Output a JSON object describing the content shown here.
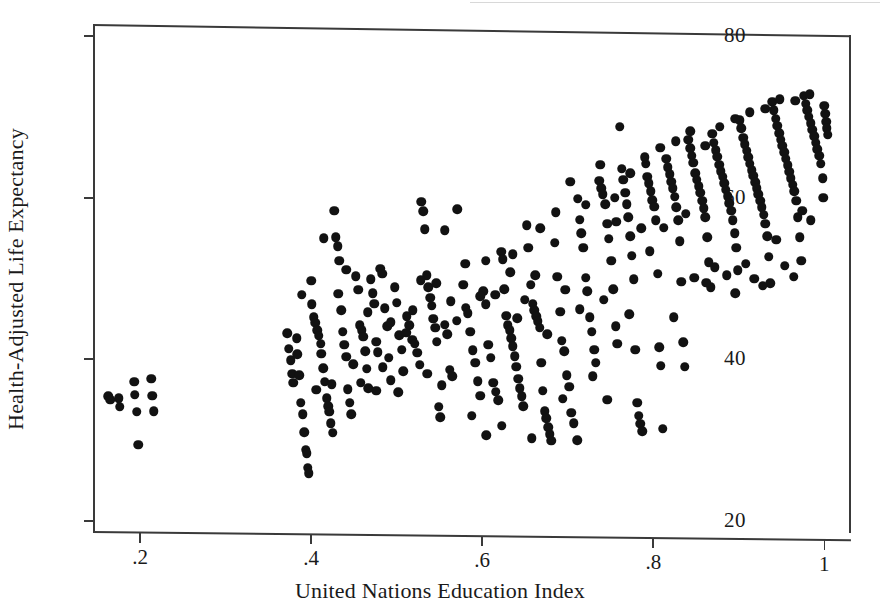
{
  "figure": {
    "kind": "scatterplot",
    "background_color": "#ffffff",
    "ink_color": "#121212",
    "axis_color": "#3a3a3a"
  },
  "chart_data": {
    "type": "scatter",
    "title": "",
    "xlabel": "United Nations Education Index",
    "ylabel": "Health-Adjusted Life Expectancy",
    "xlim": [
      0.145,
      1.03
    ],
    "ylim": [
      18.5,
      81.5
    ],
    "xticks": [
      0.2,
      0.4,
      0.6,
      0.8,
      1
    ],
    "xtick_labels": [
      ".2",
      ".4",
      ".6",
      ".8",
      "1"
    ],
    "yticks": [
      20,
      40,
      60,
      80
    ],
    "ytick_labels": [
      "20",
      "40",
      "60",
      "80"
    ],
    "grid": false,
    "legend": null,
    "marker": "filled-circle",
    "marker_color": "#121212",
    "marker_size_px": 9.5,
    "n_points": 430,
    "points": [
      [
        0.163,
        35.4
      ],
      [
        0.165,
        35.0
      ],
      [
        0.175,
        35.2
      ],
      [
        0.176,
        34.1
      ],
      [
        0.193,
        37.2
      ],
      [
        0.194,
        35.6
      ],
      [
        0.196,
        33.5
      ],
      [
        0.198,
        29.4
      ],
      [
        0.213,
        37.6
      ],
      [
        0.214,
        35.5
      ],
      [
        0.216,
        33.6
      ],
      [
        0.372,
        43.2
      ],
      [
        0.374,
        41.3
      ],
      [
        0.376,
        39.9
      ],
      [
        0.378,
        38.2
      ],
      [
        0.379,
        37.1
      ],
      [
        0.383,
        42.6
      ],
      [
        0.384,
        40.6
      ],
      [
        0.386,
        38.0
      ],
      [
        0.388,
        34.6
      ],
      [
        0.39,
        33.2
      ],
      [
        0.392,
        31.0
      ],
      [
        0.394,
        28.8
      ],
      [
        0.395,
        28.4
      ],
      [
        0.396,
        26.6
      ],
      [
        0.397,
        25.9
      ],
      [
        0.4,
        49.7
      ],
      [
        0.401,
        46.8
      ],
      [
        0.403,
        45.2
      ],
      [
        0.405,
        44.5
      ],
      [
        0.407,
        43.6
      ],
      [
        0.409,
        42.9
      ],
      [
        0.411,
        41.9
      ],
      [
        0.412,
        40.7
      ],
      [
        0.414,
        38.9
      ],
      [
        0.416,
        37.2
      ],
      [
        0.418,
        35.2
      ],
      [
        0.42,
        34.2
      ],
      [
        0.421,
        33.5
      ],
      [
        0.423,
        32.1
      ],
      [
        0.425,
        30.9
      ],
      [
        0.427,
        58.4
      ],
      [
        0.429,
        55.1
      ],
      [
        0.431,
        54.0
      ],
      [
        0.433,
        52.2
      ],
      [
        0.435,
        46.1
      ],
      [
        0.437,
        43.4
      ],
      [
        0.439,
        41.8
      ],
      [
        0.441,
        40.3
      ],
      [
        0.443,
        36.3
      ],
      [
        0.445,
        34.6
      ],
      [
        0.447,
        33.2
      ],
      [
        0.452,
        50.3
      ],
      [
        0.455,
        48.6
      ],
      [
        0.457,
        44.2
      ],
      [
        0.459,
        43.6
      ],
      [
        0.461,
        42.8
      ],
      [
        0.463,
        41.0
      ],
      [
        0.465,
        38.8
      ],
      [
        0.467,
        36.4
      ],
      [
        0.47,
        49.9
      ],
      [
        0.472,
        48.2
      ],
      [
        0.474,
        46.9
      ],
      [
        0.476,
        42.2
      ],
      [
        0.478,
        40.9
      ],
      [
        0.481,
        51.2
      ],
      [
        0.483,
        50.6
      ],
      [
        0.486,
        46.3
      ],
      [
        0.489,
        44.1
      ],
      [
        0.491,
        40.2
      ],
      [
        0.493,
        37.4
      ],
      [
        0.498,
        48.9
      ],
      [
        0.5,
        47.0
      ],
      [
        0.503,
        43.0
      ],
      [
        0.506,
        41.2
      ],
      [
        0.508,
        38.5
      ],
      [
        0.512,
        45.3
      ],
      [
        0.515,
        44.2
      ],
      [
        0.518,
        42.4
      ],
      [
        0.521,
        41.9
      ],
      [
        0.524,
        40.8
      ],
      [
        0.527,
        39.3
      ],
      [
        0.529,
        59.5
      ],
      [
        0.531,
        58.3
      ],
      [
        0.533,
        56.1
      ],
      [
        0.535,
        50.4
      ],
      [
        0.537,
        48.9
      ],
      [
        0.539,
        47.6
      ],
      [
        0.541,
        46.6
      ],
      [
        0.543,
        45.0
      ],
      [
        0.545,
        43.9
      ],
      [
        0.547,
        42.2
      ],
      [
        0.549,
        34.1
      ],
      [
        0.551,
        32.8
      ],
      [
        0.556,
        44.3
      ],
      [
        0.559,
        43.1
      ],
      [
        0.562,
        38.7
      ],
      [
        0.565,
        37.9
      ],
      [
        0.578,
        49.2
      ],
      [
        0.581,
        46.4
      ],
      [
        0.583,
        45.7
      ],
      [
        0.586,
        43.4
      ],
      [
        0.589,
        41.1
      ],
      [
        0.592,
        39.6
      ],
      [
        0.595,
        37.3
      ],
      [
        0.598,
        35.5
      ],
      [
        0.601,
        48.4
      ],
      [
        0.604,
        46.8
      ],
      [
        0.607,
        41.8
      ],
      [
        0.61,
        40.2
      ],
      [
        0.613,
        37.1
      ],
      [
        0.616,
        36.0
      ],
      [
        0.619,
        34.9
      ],
      [
        0.622,
        53.3
      ],
      [
        0.624,
        52.4
      ],
      [
        0.626,
        48.7
      ],
      [
        0.628,
        45.4
      ],
      [
        0.63,
        44.2
      ],
      [
        0.632,
        43.6
      ],
      [
        0.634,
        42.6
      ],
      [
        0.636,
        41.6
      ],
      [
        0.638,
        40.4
      ],
      [
        0.64,
        39.1
      ],
      [
        0.642,
        37.6
      ],
      [
        0.644,
        36.4
      ],
      [
        0.646,
        35.4
      ],
      [
        0.648,
        34.2
      ],
      [
        0.652,
        56.6
      ],
      [
        0.654,
        53.8
      ],
      [
        0.657,
        49.2
      ],
      [
        0.659,
        46.9
      ],
      [
        0.661,
        46.1
      ],
      [
        0.663,
        45.3
      ],
      [
        0.665,
        44.7
      ],
      [
        0.667,
        43.9
      ],
      [
        0.669,
        39.6
      ],
      [
        0.671,
        36.1
      ],
      [
        0.673,
        33.6
      ],
      [
        0.675,
        32.7
      ],
      [
        0.677,
        31.6
      ],
      [
        0.679,
        30.7
      ],
      [
        0.681,
        29.9
      ],
      [
        0.685,
        54.4
      ],
      [
        0.688,
        50.2
      ],
      [
        0.691,
        45.9
      ],
      [
        0.693,
        42.3
      ],
      [
        0.696,
        41.0
      ],
      [
        0.699,
        38.0
      ],
      [
        0.702,
        36.6
      ],
      [
        0.704,
        33.4
      ],
      [
        0.707,
        32.1
      ],
      [
        0.712,
        59.9
      ],
      [
        0.714,
        57.3
      ],
      [
        0.716,
        55.6
      ],
      [
        0.718,
        53.8
      ],
      [
        0.721,
        50.1
      ],
      [
        0.723,
        48.4
      ],
      [
        0.726,
        45.2
      ],
      [
        0.728,
        43.4
      ],
      [
        0.731,
        41.2
      ],
      [
        0.733,
        39.6
      ],
      [
        0.737,
        62.1
      ],
      [
        0.739,
        61.2
      ],
      [
        0.741,
        60.4
      ],
      [
        0.744,
        59.2
      ],
      [
        0.746,
        56.8
      ],
      [
        0.748,
        54.9
      ],
      [
        0.751,
        52.2
      ],
      [
        0.753,
        48.7
      ],
      [
        0.756,
        44.1
      ],
      [
        0.758,
        41.9
      ],
      [
        0.761,
        68.8
      ],
      [
        0.763,
        63.6
      ],
      [
        0.765,
        62.2
      ],
      [
        0.767,
        60.6
      ],
      [
        0.769,
        59.2
      ],
      [
        0.771,
        57.6
      ],
      [
        0.773,
        55.2
      ],
      [
        0.775,
        52.8
      ],
      [
        0.777,
        49.9
      ],
      [
        0.779,
        41.2
      ],
      [
        0.781,
        34.6
      ],
      [
        0.783,
        33.0
      ],
      [
        0.785,
        32.0
      ],
      [
        0.787,
        31.1
      ],
      [
        0.791,
        64.2
      ],
      [
        0.793,
        62.6
      ],
      [
        0.795,
        61.8
      ],
      [
        0.797,
        60.8
      ],
      [
        0.799,
        59.7
      ],
      [
        0.801,
        58.9
      ],
      [
        0.803,
        57.2
      ],
      [
        0.805,
        50.6
      ],
      [
        0.807,
        41.5
      ],
      [
        0.809,
        39.2
      ],
      [
        0.811,
        31.4
      ],
      [
        0.815,
        64.8
      ],
      [
        0.817,
        63.8
      ],
      [
        0.819,
        62.9
      ],
      [
        0.821,
        62.0
      ],
      [
        0.823,
        61.2
      ],
      [
        0.825,
        60.1
      ],
      [
        0.827,
        58.8
      ],
      [
        0.829,
        57.2
      ],
      [
        0.831,
        54.6
      ],
      [
        0.833,
        49.6
      ],
      [
        0.835,
        42.1
      ],
      [
        0.837,
        39.1
      ],
      [
        0.841,
        67.2
      ],
      [
        0.843,
        66.1
      ],
      [
        0.845,
        65.2
      ],
      [
        0.847,
        64.3
      ],
      [
        0.849,
        63.0
      ],
      [
        0.851,
        62.2
      ],
      [
        0.853,
        61.4
      ],
      [
        0.855,
        60.6
      ],
      [
        0.857,
        59.6
      ],
      [
        0.859,
        58.7
      ],
      [
        0.861,
        57.6
      ],
      [
        0.863,
        55.1
      ],
      [
        0.865,
        52.0
      ],
      [
        0.867,
        48.9
      ],
      [
        0.869,
        67.9
      ],
      [
        0.871,
        66.8
      ],
      [
        0.873,
        65.9
      ],
      [
        0.875,
        65.1
      ],
      [
        0.877,
        64.1
      ],
      [
        0.879,
        63.3
      ],
      [
        0.881,
        62.6
      ],
      [
        0.883,
        61.8
      ],
      [
        0.885,
        61.0
      ],
      [
        0.887,
        60.2
      ],
      [
        0.889,
        59.3
      ],
      [
        0.891,
        58.4
      ],
      [
        0.893,
        57.2
      ],
      [
        0.895,
        55.6
      ],
      [
        0.897,
        53.8
      ],
      [
        0.899,
        51.0
      ],
      [
        0.901,
        69.6
      ],
      [
        0.903,
        68.6
      ],
      [
        0.905,
        67.4
      ],
      [
        0.907,
        66.6
      ],
      [
        0.909,
        65.8
      ],
      [
        0.911,
        65.0
      ],
      [
        0.913,
        64.2
      ],
      [
        0.915,
        63.4
      ],
      [
        0.917,
        62.7
      ],
      [
        0.919,
        61.9
      ],
      [
        0.921,
        61.2
      ],
      [
        0.923,
        60.4
      ],
      [
        0.925,
        59.6
      ],
      [
        0.927,
        58.8
      ],
      [
        0.929,
        57.9
      ],
      [
        0.931,
        56.8
      ],
      [
        0.933,
        55.2
      ],
      [
        0.935,
        52.7
      ],
      [
        0.937,
        49.4
      ],
      [
        0.939,
        71.9
      ],
      [
        0.941,
        70.8
      ],
      [
        0.943,
        69.8
      ],
      [
        0.945,
        68.9
      ],
      [
        0.947,
        68.0
      ],
      [
        0.949,
        67.2
      ],
      [
        0.951,
        66.4
      ],
      [
        0.953,
        65.6
      ],
      [
        0.955,
        64.8
      ],
      [
        0.957,
        64.0
      ],
      [
        0.959,
        63.2
      ],
      [
        0.961,
        62.4
      ],
      [
        0.963,
        61.6
      ],
      [
        0.965,
        60.8
      ],
      [
        0.967,
        59.6
      ],
      [
        0.969,
        57.6
      ],
      [
        0.971,
        55.1
      ],
      [
        0.973,
        52.2
      ],
      [
        0.976,
        72.6
      ],
      [
        0.978,
        71.6
      ],
      [
        0.98,
        70.8
      ],
      [
        0.982,
        70.0
      ],
      [
        0.984,
        69.2
      ],
      [
        0.986,
        68.4
      ],
      [
        0.988,
        67.6
      ],
      [
        0.99,
        66.8
      ],
      [
        0.992,
        66.0
      ],
      [
        0.994,
        65.2
      ],
      [
        0.996,
        64.2
      ],
      [
        0.998,
        62.4
      ],
      [
        0.999,
        60.0
      ],
      [
        1.0,
        71.4
      ],
      [
        1.001,
        70.4
      ],
      [
        1.002,
        69.4
      ],
      [
        1.003,
        68.6
      ],
      [
        1.004,
        67.8
      ],
      [
        0.556,
        56.0
      ],
      [
        0.571,
        58.6
      ],
      [
        0.604,
        52.2
      ],
      [
        0.636,
        53.0
      ],
      [
        0.662,
        50.4
      ],
      [
        0.697,
        48.6
      ],
      [
        0.714,
        46.2
      ],
      [
        0.742,
        47.4
      ],
      [
        0.757,
        57.0
      ],
      [
        0.772,
        45.6
      ],
      [
        0.786,
        56.2
      ],
      [
        0.796,
        53.4
      ],
      [
        0.812,
        56.3
      ],
      [
        0.824,
        45.2
      ],
      [
        0.838,
        58.0
      ],
      [
        0.848,
        50.1
      ],
      [
        0.862,
        49.5
      ],
      [
        0.872,
        51.4
      ],
      [
        0.886,
        50.4
      ],
      [
        0.896,
        48.2
      ],
      [
        0.908,
        51.8
      ],
      [
        0.918,
        50.0
      ],
      [
        0.928,
        49.1
      ],
      [
        0.944,
        54.8
      ],
      [
        0.954,
        51.6
      ],
      [
        0.964,
        50.2
      ],
      [
        0.974,
        58.4
      ],
      [
        0.984,
        57.2
      ],
      [
        0.415,
        55.0
      ],
      [
        0.432,
        48.1
      ],
      [
        0.449,
        39.4
      ],
      [
        0.466,
        45.8
      ],
      [
        0.484,
        39.0
      ],
      [
        0.502,
        35.9
      ],
      [
        0.519,
        46.1
      ],
      [
        0.536,
        38.2
      ],
      [
        0.553,
        36.8
      ],
      [
        0.57,
        44.8
      ],
      [
        0.588,
        33.0
      ],
      [
        0.605,
        30.6
      ],
      [
        0.623,
        31.8
      ],
      [
        0.641,
        45.1
      ],
      [
        0.658,
        30.2
      ],
      [
        0.676,
        43.1
      ],
      [
        0.694,
        35.1
      ],
      [
        0.711,
        30.0
      ],
      [
        0.729,
        37.9
      ],
      [
        0.746,
        35.0
      ],
      [
        0.389,
        48.0
      ],
      [
        0.406,
        36.2
      ],
      [
        0.424,
        36.9
      ],
      [
        0.441,
        51.1
      ],
      [
        0.458,
        37.1
      ],
      [
        0.476,
        36.1
      ],
      [
        0.493,
        44.6
      ],
      [
        0.511,
        43.3
      ],
      [
        0.528,
        49.8
      ],
      [
        0.546,
        49.4
      ],
      [
        0.563,
        47.2
      ],
      [
        0.58,
        51.8
      ],
      [
        0.598,
        47.8
      ],
      [
        0.615,
        48.0
      ],
      [
        0.633,
        50.8
      ],
      [
        0.65,
        47.4
      ],
      [
        0.668,
        56.2
      ],
      [
        0.686,
        58.2
      ],
      [
        0.703,
        62.0
      ],
      [
        0.721,
        59.1
      ],
      [
        0.738,
        64.1
      ],
      [
        0.755,
        60.0
      ],
      [
        0.773,
        63.0
      ],
      [
        0.79,
        65.0
      ],
      [
        0.808,
        66.2
      ],
      [
        0.826,
        67.0
      ],
      [
        0.843,
        68.2
      ],
      [
        0.861,
        66.4
      ],
      [
        0.878,
        68.8
      ],
      [
        0.896,
        69.8
      ],
      [
        0.913,
        70.6
      ],
      [
        0.931,
        71.0
      ],
      [
        0.948,
        72.2
      ],
      [
        0.966,
        72.0
      ],
      [
        0.983,
        72.8
      ]
    ]
  }
}
